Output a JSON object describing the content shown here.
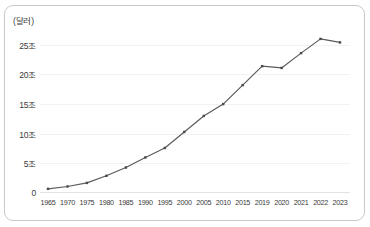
{
  "chart_data": {
    "type": "line",
    "title": "",
    "subtitle": "",
    "xlabel": "",
    "ylabel": "",
    "unit_label": "(달러)",
    "categories": [
      "1965",
      "1970",
      "1975",
      "1980",
      "1985",
      "1990",
      "1995",
      "2000",
      "2005",
      "2010",
      "2015",
      "2019",
      "2020",
      "2021",
      "2022",
      "2023"
    ],
    "values": [
      0.7,
      1.1,
      1.7,
      2.9,
      4.3,
      6.0,
      7.6,
      10.3,
      13.0,
      15.0,
      18.2,
      21.4,
      21.1,
      23.6,
      26.0,
      25.4
    ],
    "y_ticks": [
      0,
      5,
      10,
      15,
      20,
      25
    ],
    "y_tick_labels": [
      "0",
      "5조",
      "10조",
      "15조",
      "20조",
      "25조"
    ],
    "ylim": [
      0,
      27.5
    ],
    "grid": true,
    "grid_axis": "y",
    "legend": false,
    "legend_position": "none",
    "series": [
      {
        "name": "",
        "values": [
          0.7,
          1.1,
          1.7,
          2.9,
          4.3,
          6.0,
          7.6,
          10.3,
          13.0,
          15.0,
          18.2,
          21.4,
          21.1,
          23.6,
          26.0,
          25.4
        ]
      }
    ],
    "colors": {
      "line": "#5b5b5b",
      "marker": "#4a4a4a",
      "grid": "#f2f2f2",
      "axis": "#e3e3e3",
      "frame": "#c9c9c9",
      "text": "#3a3a3a",
      "background": "#ffffff"
    }
  }
}
